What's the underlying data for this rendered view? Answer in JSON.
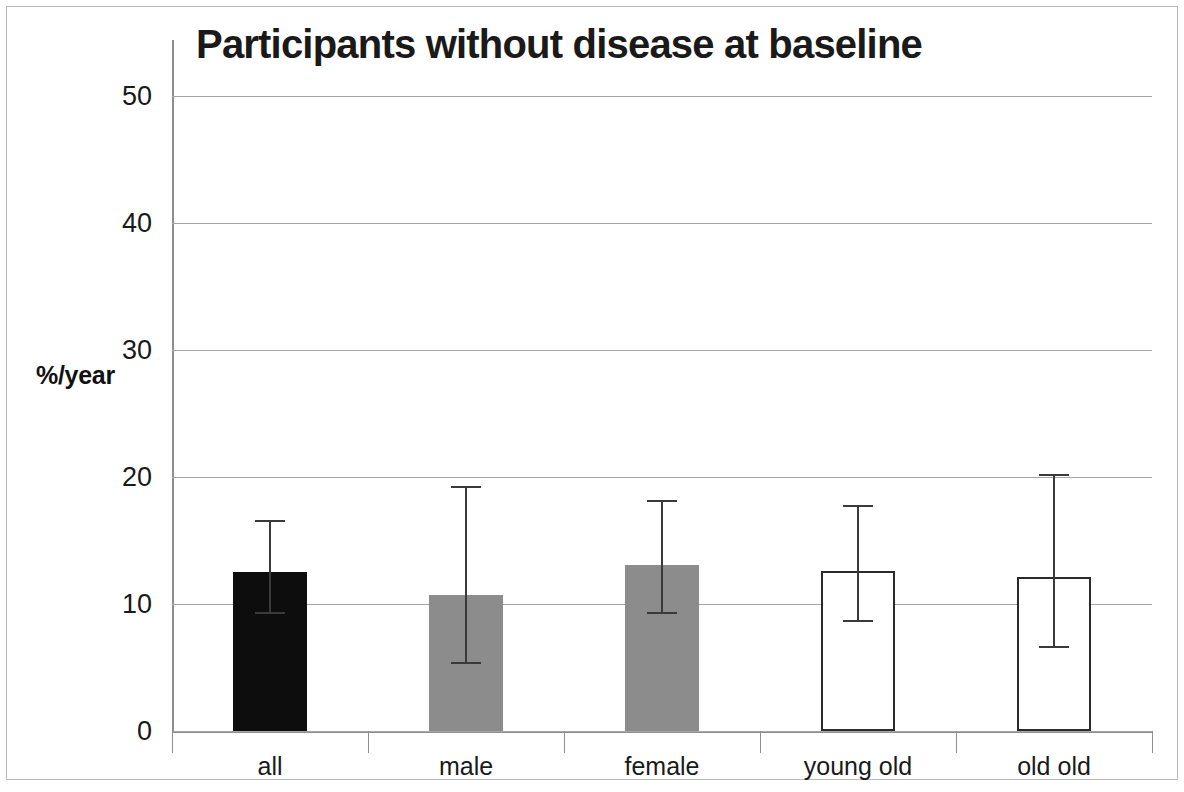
{
  "chart_data": {
    "type": "bar",
    "title": "Participants without disease at baseline",
    "xlabel": "",
    "ylabel": "%/year",
    "categories": [
      "all",
      "male",
      "female",
      "young old",
      "old old"
    ],
    "values": [
      12.5,
      10.7,
      13.1,
      12.6,
      12.1
    ],
    "error_low": [
      9.2,
      5.3,
      9.2,
      8.6,
      6.5
    ],
    "error_high": [
      16.6,
      19.3,
      18.2,
      17.8,
      20.2
    ],
    "bar_styles": [
      "black",
      "gray",
      "gray",
      "white",
      "white"
    ],
    "ylim": [
      0,
      50
    ],
    "yticks": [
      0,
      10,
      20,
      30,
      40,
      50
    ],
    "ytick_labels": [
      "0",
      "10",
      "20",
      "30",
      "40",
      "50"
    ],
    "grid": true,
    "legend": "none",
    "colors": {
      "black_bar": "#0d0d0d",
      "gray_bar": "#8c8c8c",
      "white_bar": "#ffffff",
      "bar_outline": "#2b2b2b",
      "gridline": "#a6a6a6",
      "axis": "#8f8f8f",
      "text": "#1a1a1a",
      "frame": "#b9b9b9"
    }
  }
}
